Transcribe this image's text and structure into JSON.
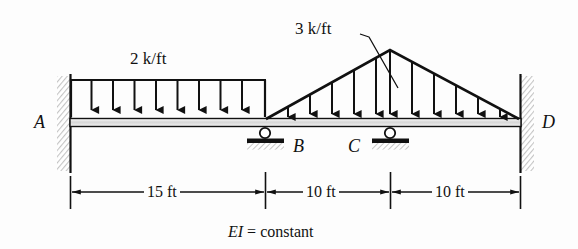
{
  "figure": {
    "caption": "EI = constant",
    "caption_italic_part": "EI",
    "caption_rest": " = constant"
  },
  "loads": [
    {
      "id": "uniform-load-ab",
      "label": "2 k/ft",
      "type": "uniformly-distributed",
      "magnitude": 2,
      "unit": "k/ft",
      "start_node": "A",
      "end_node": "B",
      "arrow_count": 10
    },
    {
      "id": "triangular-load-bd",
      "label": "3 k/ft",
      "type": "triangular-distributed",
      "peak_magnitude": 3,
      "unit": "k/ft",
      "start_node": "B",
      "peak_node": "C",
      "end_node": "D",
      "arrow_count": 11
    }
  ],
  "nodes": [
    {
      "id": "A",
      "label": "A",
      "support": "fixed-wall"
    },
    {
      "id": "B",
      "label": "B",
      "support": "roller"
    },
    {
      "id": "C",
      "label": "C",
      "support": "roller"
    },
    {
      "id": "D",
      "label": "D",
      "support": "fixed-wall"
    }
  ],
  "dimensions": [
    {
      "id": "dim-ab",
      "label": "15 ft",
      "value": 15,
      "unit": "ft",
      "from": "A",
      "to": "B"
    },
    {
      "id": "dim-bc",
      "label": "10 ft",
      "value": 10,
      "unit": "ft",
      "from": "B",
      "to": "C"
    },
    {
      "id": "dim-cd",
      "label": "10 ft",
      "value": 10,
      "unit": "ft",
      "from": "C",
      "to": "D"
    }
  ],
  "colors": {
    "ink": "#111111",
    "paper": "#fdfdfd",
    "wall_hatch": "#c9c9c9",
    "beam_fill": "#d8d8d8"
  }
}
